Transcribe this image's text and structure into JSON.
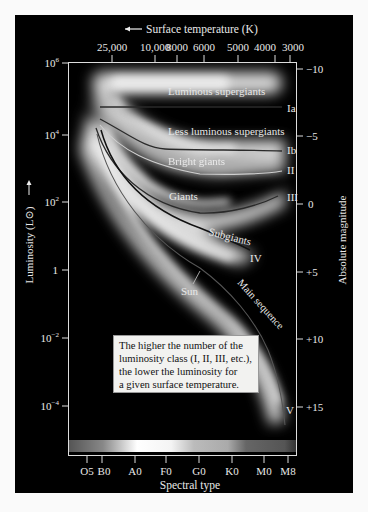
{
  "top_axis": {
    "title": "Surface temperature (K)",
    "arrow_icon": "left-arrow",
    "ticks": [
      "25,000",
      "10,000",
      "8000",
      "6000",
      "5000",
      "4000",
      "3000"
    ]
  },
  "left_axis": {
    "title": "Luminosity (L⊙)",
    "ticks": [
      "10^6",
      "10^4",
      "10^2",
      "1",
      "10^-2",
      "10^-4"
    ]
  },
  "right_axis": {
    "title": "Absolute magnitude",
    "ticks": [
      "−10",
      "−5",
      "0",
      "+5",
      "+10",
      "+15"
    ]
  },
  "bottom_axis": {
    "title": "Spectral type",
    "ticks": [
      "O5",
      "B0",
      "A0",
      "F0",
      "G0",
      "K0",
      "M0",
      "M8"
    ]
  },
  "regions": {
    "luminous_supergiants": "Luminous supergiants",
    "less_luminous_supergiants": "Less luminous supergiants",
    "bright_giants": "Bright giants",
    "giants": "Giants",
    "subgiants": "Subgiants",
    "main_sequence": "Main sequence",
    "sun": "Sun"
  },
  "classes": {
    "ia": "Ia",
    "ib": "Ib",
    "ii": "II",
    "iii": "III",
    "iv": "IV",
    "v": "V"
  },
  "note": {
    "lines": [
      "The higher the number of the",
      "luminosity class (I, II, III, etc.),",
      "the lower the luminosity for",
      "a given surface temperature."
    ]
  },
  "colors": {
    "background": "#000000",
    "band_glow": "#e6e6e6",
    "class_line_dark": "#2a2a2a",
    "class_ii_line": "#cfcfcf"
  }
}
